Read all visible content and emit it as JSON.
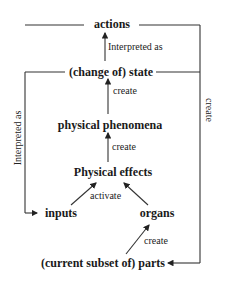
{
  "diagram": {
    "nodes": {
      "actions": "actions",
      "state": "(change of) state",
      "phenomena": "physical phenomena",
      "effects": "Physical effects",
      "inputs": "inputs",
      "organs": "organs",
      "parts": "(current subset of) parts"
    },
    "edges": {
      "state_to_actions": "Interpreted as",
      "phenomena_to_state": "create",
      "effects_to_phenomena": "create",
      "inputs_organs_to_effects": "activate",
      "parts_to_organs": "create",
      "state_to_inputs_left": "Interpreted as",
      "actions_to_parts_right": "create"
    }
  }
}
